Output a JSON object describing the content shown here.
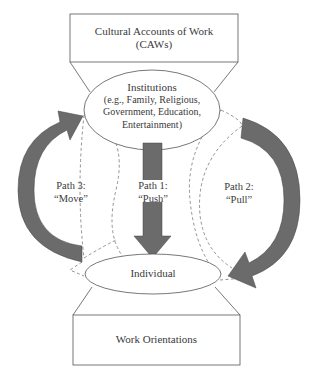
{
  "diagram": {
    "top_box": {
      "line1": "Cultural Accounts of Work",
      "line2": "(CAWs)"
    },
    "institutions": {
      "title": "Institutions",
      "line2": "(e.g., Family, Religious,",
      "line3": "Government, Education,",
      "line4": "Entertainment)"
    },
    "individual": {
      "label": "Individual"
    },
    "bottom_box": {
      "label": "Work Orientations"
    },
    "paths": [
      {
        "id": "path1",
        "title": "Path 1:",
        "name": "“Push”",
        "direction": "down"
      },
      {
        "id": "path2",
        "title": "Path 2:",
        "name": "“Pull”",
        "direction": "clockwise-right"
      },
      {
        "id": "path3",
        "title": "Path 3:",
        "name": "“Move”",
        "direction": "counterclockwise-left"
      }
    ],
    "colors": {
      "arrow_fill": "#6b6b6b",
      "line": "#555555",
      "dashed": "#777777"
    }
  }
}
